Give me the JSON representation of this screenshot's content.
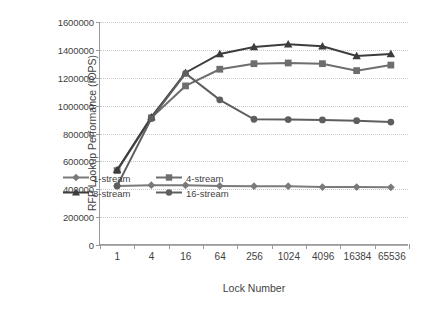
{
  "chart_data": {
    "type": "line",
    "title": "",
    "xlabel": "Lock Number",
    "ylabel": "RFP Lookup Performance (IOPS)",
    "categories": [
      "1",
      "4",
      "16",
      "64",
      "256",
      "1024",
      "4096",
      "16384",
      "65536"
    ],
    "ylim": [
      0,
      1600000
    ],
    "ytick_values": [
      0,
      200000,
      400000,
      600000,
      800000,
      1000000,
      1200000,
      1400000,
      1600000
    ],
    "ytick_labels": [
      "0",
      "200000",
      "400000",
      "600000",
      "800000",
      "1000000",
      "1200000",
      "1400000",
      "1600000"
    ],
    "grid": true,
    "legend_position": "inside-bottom-center",
    "series": [
      {
        "name": "1-stream",
        "marker": "diamond",
        "color": "#7a7a7a",
        "values": [
          420000,
          425000,
          425000,
          420000,
          418000,
          418000,
          412000,
          412000,
          410000
        ]
      },
      {
        "name": "4-stream",
        "marker": "square",
        "color": "#6e6e6e",
        "values": [
          530000,
          910000,
          1140000,
          1260000,
          1300000,
          1305000,
          1300000,
          1250000,
          1290000
        ]
      },
      {
        "name": "8-stream",
        "marker": "triangle",
        "color": "#3d3d3d",
        "values": [
          535000,
          915000,
          1235000,
          1370000,
          1420000,
          1440000,
          1425000,
          1355000,
          1370000
        ]
      },
      {
        "name": "16-stream",
        "marker": "circle",
        "color": "#5e5e5e",
        "values": [
          420000,
          905000,
          1230000,
          1040000,
          900000,
          898000,
          895000,
          890000,
          880000
        ]
      }
    ]
  }
}
